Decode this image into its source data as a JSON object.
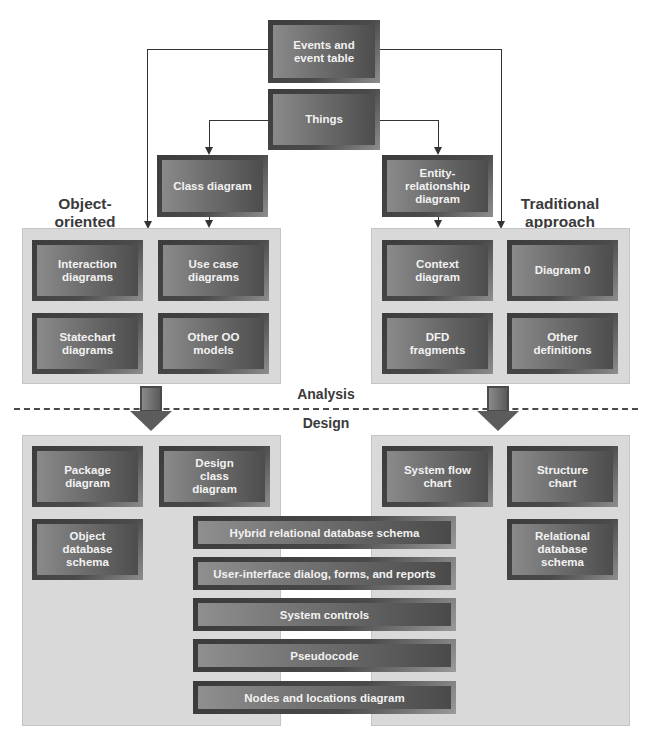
{
  "top": {
    "events_box": "Events and event table",
    "things_box": "Things",
    "class_box": "Class diagram",
    "er_box": "Entity-relationship diagram"
  },
  "labels": {
    "oo_approach": "Object-oriented approach",
    "traditional_approach": "Traditional approach",
    "analysis": "Analysis",
    "design": "Design"
  },
  "analysis": {
    "oo": [
      "Interaction diagrams",
      "Use case diagrams",
      "Statechart diagrams",
      "Other OO models"
    ],
    "traditional": [
      "Context diagram",
      "Diagram 0",
      "DFD fragments",
      "Other definitions"
    ]
  },
  "design": {
    "oo": [
      "Package diagram",
      "Design class diagram",
      "Object database schema"
    ],
    "traditional": [
      "System flow chart",
      "Structure chart",
      "Relational database schema"
    ],
    "shared": [
      "Hybrid relational database schema",
      "User-interface dialog, forms, and reports",
      "System controls",
      "Pseudocode",
      "Nodes and locations diagram"
    ]
  },
  "colors": {
    "panel_bg": "#d9d9d9",
    "box_dark": "#3c3c3c",
    "box_light": "#8a8a8a",
    "box_text": "#f2f2f2",
    "label_text": "#3a3a3a"
  }
}
